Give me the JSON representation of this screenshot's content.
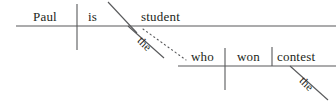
{
  "diagram": {
    "type": "reed-kellogg-sentence-diagram",
    "sentence": "Paul is the student who won the contest",
    "colors": {
      "ink": "#231f20",
      "line": "#58595b",
      "background": "#ffffff"
    },
    "clauses": [
      {
        "id": "main-clause",
        "baseline": {
          "x1": 16,
          "y1": 26,
          "x2": 336,
          "y2": 26
        },
        "words": [
          {
            "id": "subject",
            "role": "subject",
            "text": "Paul",
            "x": 33,
            "y": 10
          },
          {
            "id": "linking-verb",
            "role": "linking-verb",
            "text": "is",
            "x": 88,
            "y": 10
          },
          {
            "id": "predicate-nominative",
            "role": "predicate-nominative",
            "text": "student",
            "x": 141,
            "y": 10
          },
          {
            "id": "article-student",
            "role": "article-modifier",
            "text": "the",
            "x": 143,
            "y": 35,
            "rotation": 45
          }
        ],
        "dividers": [
          {
            "id": "subject-verb-divider",
            "kind": "vertical-full",
            "x": 77,
            "y1": 4,
            "y2": 50
          },
          {
            "id": "predicate-nominative-slant",
            "kind": "slant",
            "x1": 108,
            "y1": 2,
            "x2": 137,
            "y2": 33
          }
        ],
        "modifier_lines": [
          {
            "id": "the-student-line",
            "x1": 128,
            "y1": 26,
            "x2": 164,
            "y2": 58
          }
        ]
      },
      {
        "id": "relative-clause",
        "baseline": {
          "x1": 178,
          "y1": 66,
          "x2": 336,
          "y2": 66
        },
        "words": [
          {
            "id": "relative-pronoun",
            "role": "subject",
            "text": "who",
            "x": 191,
            "y": 50
          },
          {
            "id": "verb",
            "role": "verb",
            "text": "won",
            "x": 237,
            "y": 50
          },
          {
            "id": "direct-object",
            "role": "direct-object",
            "text": "contest",
            "x": 277,
            "y": 50
          },
          {
            "id": "article-contest",
            "role": "article-modifier",
            "text": "the",
            "x": 305,
            "y": 75,
            "rotation": 45
          }
        ],
        "dividers": [
          {
            "id": "who-won-divider",
            "kind": "vertical-full",
            "x": 225,
            "y1": 48,
            "y2": 90
          },
          {
            "id": "won-contest-divider",
            "kind": "vertical-short",
            "x": 272,
            "y1": 47,
            "y2": 66
          }
        ],
        "modifier_lines": [
          {
            "id": "the-contest-line",
            "x1": 290,
            "y1": 66,
            "x2": 328,
            "y2": 100
          }
        ]
      }
    ],
    "connector": {
      "id": "relative-clause-connector",
      "style": "dotted",
      "x1": 143,
      "y1": 29,
      "x2": 186,
      "y2": 60
    }
  }
}
